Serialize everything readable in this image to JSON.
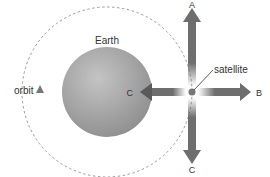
{
  "diagram": {
    "labels": {
      "earth": "Earth",
      "orbit": "orbit",
      "satellite": "satellite",
      "arrow_up": "A",
      "arrow_right": "B",
      "arrow_left": "C",
      "arrow_down": "C"
    },
    "colors": {
      "earth_fill": "#a8a8a8",
      "arrow_fill": "#6e6e6e",
      "orbit_stroke": "#9a9a9a",
      "satellite_fill": "#777777",
      "text": "#333333"
    }
  }
}
